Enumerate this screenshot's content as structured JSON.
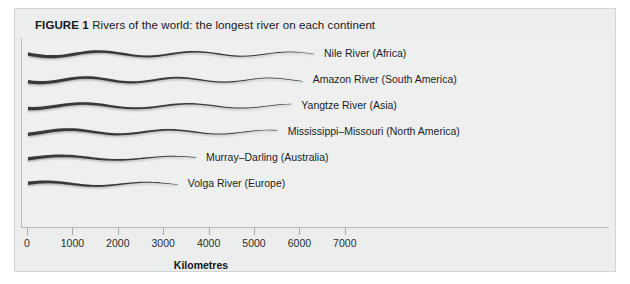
{
  "figure": {
    "label": "FIGURE 1",
    "title": "Rivers of the world: the longest river on each continent"
  },
  "axis": {
    "title": "Kilometres",
    "ticks": [
      "0",
      "1000",
      "2000",
      "3000",
      "4000",
      "5000",
      "6000",
      "7000"
    ]
  },
  "chart_data": {
    "type": "bar",
    "orientation": "horizontal",
    "title": "Rivers of the world: the longest river on each continent",
    "xlabel": "Kilometres",
    "ylabel": "",
    "xlim": [
      0,
      7800
    ],
    "grid": false,
    "legend": "none",
    "note": "Bars are drawn as stylised tapering river ribbons; lengths read off the Kilometres axis.",
    "categories": [
      "Nile River (Africa)",
      "Amazon River (South America)",
      "Yangtze River (Asia)",
      "Mississippi–Missouri (North America)",
      "Murray–Darling (Australia)",
      "Volga River (Europe)"
    ],
    "values": [
      6300,
      6050,
      5800,
      5500,
      3700,
      3300
    ],
    "series": [
      {
        "name": "River length",
        "values": [
          6300,
          6050,
          5800,
          5500,
          3700,
          3300
        ]
      }
    ]
  },
  "rivers": [
    {
      "label": "Nile River (Africa)",
      "km": 6300
    },
    {
      "label": "Amazon River (South America)",
      "km": 6050
    },
    {
      "label": "Yangtze River (Asia)",
      "km": 5800
    },
    {
      "label": "Mississippi–Missouri (North America)",
      "km": 5500
    },
    {
      "label": "Murray–Darling (Australia)",
      "km": 3700
    },
    {
      "label": "Volga River (Europe)",
      "km": 3300
    }
  ],
  "colors": {
    "panel": "#eceded",
    "plot": "#eef0f0",
    "river": "#2e3033",
    "axis": "#b9babb",
    "text": "#17181a"
  }
}
